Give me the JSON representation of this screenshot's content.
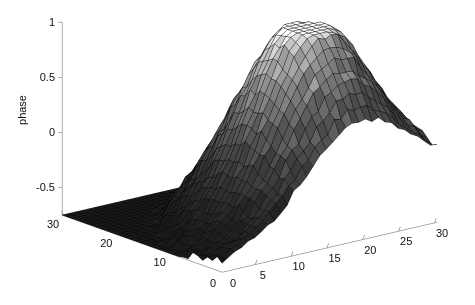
{
  "figure": {
    "background_color": "#ffffff",
    "axis_color": "#999999",
    "text_color": "#0d0d0d",
    "width": 475,
    "height": 305
  },
  "chart_data": {
    "type": "surface",
    "title": "",
    "xlabel": "",
    "ylabel": "",
    "zlabel": "phase",
    "colormap": "gray",
    "shading": "faceted",
    "mesh_line_color": "#000000",
    "grid": false,
    "legend": null,
    "xlim": [
      0,
      30
    ],
    "ylim": [
      0,
      30
    ],
    "zlim": [
      -0.75,
      1.0
    ],
    "x_ticks": [
      0,
      5,
      10,
      15,
      20,
      25,
      30
    ],
    "x_tick_labels": [
      "0",
      "5",
      "10",
      "15",
      "20",
      "25",
      "30"
    ],
    "y_ticks": [
      0,
      10,
      20,
      30
    ],
    "y_tick_labels": [
      "0",
      "10",
      "20",
      "30"
    ],
    "z_ticks": [
      -0.5,
      0,
      0.5,
      1
    ],
    "z_tick_labels": [
      "-0.5",
      "0",
      "0.5",
      "1"
    ],
    "view": {
      "azimuth": -37.5,
      "elevation": 30
    },
    "surface_model": {
      "description": "smooth unimodal phase dome with additive surface roughness",
      "grid_nx": 34,
      "grid_ny": 34,
      "peak_value": 1.0,
      "floor_value": -0.72,
      "peak_x": 19.0,
      "peak_y": 10.5,
      "sigma_x": 10.2,
      "sigma_y": 11.6,
      "tilt_x": 0.012,
      "tilt_y": -0.016,
      "noise_amplitude": 0.028,
      "ridge_amplitude": 0.05
    }
  },
  "axes_geometry": {
    "origin_front": [
      222,
      272
    ],
    "corner_left": [
      62,
      215
    ],
    "corner_right": [
      437,
      222
    ],
    "z_top": [
      62,
      22
    ],
    "z_bottom": [
      62,
      215
    ]
  },
  "z_axis_title_position": [
    22,
    110
  ]
}
